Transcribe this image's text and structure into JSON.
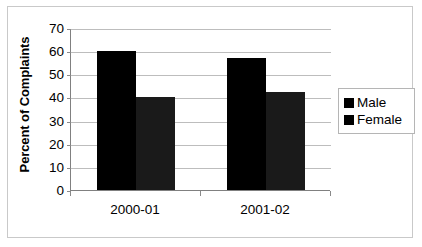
{
  "chart_data": {
    "type": "bar",
    "title": "",
    "xlabel": "",
    "ylabel": "Percent of Complaints",
    "categories": [
      "2000-01",
      "2001-02"
    ],
    "series": [
      {
        "name": "Male",
        "color": "#000000",
        "values": [
          60,
          57
        ]
      },
      {
        "name": "Female",
        "color": "#1a1a1a",
        "values": [
          40,
          42.5
        ]
      }
    ],
    "ylim": [
      0,
      70
    ],
    "ytick_labels": [
      "0",
      "10",
      "20",
      "30",
      "40",
      "50",
      "60",
      "70"
    ],
    "ytick_values": [
      0,
      10,
      20,
      30,
      40,
      50,
      60,
      70
    ],
    "grid": true,
    "legend_position": "right",
    "orientation": "vertical",
    "bar_grouping": "grouped"
  },
  "legend": {
    "items": [
      {
        "label": "Male"
      },
      {
        "label": "Female"
      }
    ]
  },
  "axes": {
    "y_title": "Percent of Complaints"
  }
}
